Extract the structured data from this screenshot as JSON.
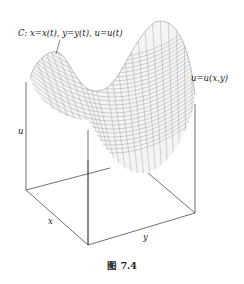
{
  "labels": {
    "curve": "C: x=x(t), y=y(t), u=u(t)",
    "surface": "u=u(x,y)",
    "axis_u": "u",
    "axis_x": "x",
    "axis_y": "y"
  },
  "caption": "图 7.4",
  "colors": {
    "axis": "#333333",
    "mesh": "#8a8a8a"
  }
}
